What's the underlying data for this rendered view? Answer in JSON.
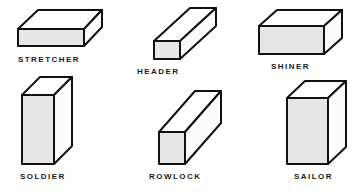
{
  "figure": {
    "name": "brick-position-names-diagram",
    "background_color": "#ffffff",
    "stroke_color": "#111111",
    "top_face_color": "#ffffff",
    "front_face_color": "#e6e6e6",
    "side_face_color": "#fbfbfb"
  },
  "bricks": [
    {
      "id": "stretcher",
      "label": "STRETCHER",
      "description": "horizontal brick laid flat with long face showing",
      "row": 1,
      "column": 1,
      "label_x": 18,
      "label_y": 56,
      "shape_x": 14,
      "shape_y": 8,
      "shape_w": 96,
      "shape_h": 46
    },
    {
      "id": "header",
      "label": "HEADER",
      "description": "brick laid flat with short end face showing",
      "row": 1,
      "column": 2,
      "label_x": 137,
      "label_y": 68,
      "shape_x": 134,
      "shape_y": 6,
      "shape_w": 86,
      "shape_h": 58
    },
    {
      "id": "shiner",
      "label": "SHINER",
      "description": "brick laid on long narrow side with broad face showing",
      "row": 1,
      "column": 3,
      "label_x": 271,
      "label_y": 63,
      "shape_x": 256,
      "shape_y": 8,
      "shape_w": 92,
      "shape_h": 50
    },
    {
      "id": "soldier",
      "label": "SOLDIER",
      "description": "brick standing on end with narrow face showing",
      "row": 2,
      "column": 1,
      "label_x": 20,
      "label_y": 173,
      "shape_x": 18,
      "shape_y": 74,
      "shape_w": 74,
      "shape_h": 94
    },
    {
      "id": "rowlock",
      "label": "ROWLOCK",
      "description": "brick laid on long narrow side with end face showing",
      "row": 2,
      "column": 2,
      "label_x": 149,
      "label_y": 173,
      "shape_x": 140,
      "shape_y": 88,
      "shape_w": 86,
      "shape_h": 80
    },
    {
      "id": "sailor",
      "label": "SAILOR",
      "description": "brick standing on end with broad face showing",
      "row": 2,
      "column": 3,
      "label_x": 294,
      "label_y": 173,
      "shape_x": 284,
      "shape_y": 78,
      "shape_w": 72,
      "shape_h": 90
    }
  ]
}
